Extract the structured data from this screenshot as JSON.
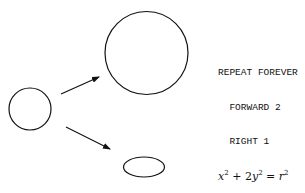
{
  "diagram": {
    "shapes": [
      {
        "id": "source-circle",
        "kind": "circle",
        "role": "original shape"
      },
      {
        "id": "large-circle",
        "kind": "circle",
        "role": "scaled-up result"
      },
      {
        "id": "ellipse",
        "kind": "ellipse",
        "role": "squashed result"
      }
    ],
    "arrows": [
      {
        "from": "source-circle",
        "to": "large-circle"
      },
      {
        "from": "source-circle",
        "to": "ellipse"
      }
    ],
    "stroke_color": "#111111"
  },
  "code": {
    "lines": [
      "REPEAT FOREVER",
      "  FORWARD 2",
      "  RIGHT 1"
    ]
  },
  "equation": {
    "term1_var": "x",
    "term1_exp": "2",
    "plus": " + ",
    "term2_coef": "2",
    "term2_var": "y",
    "term2_exp": "2",
    "equals": " = ",
    "rhs_var": "r",
    "rhs_exp": "2"
  }
}
